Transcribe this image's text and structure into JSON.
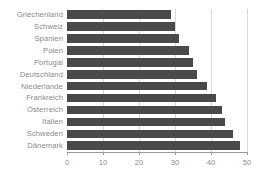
{
  "chart_data": {
    "type": "bar",
    "orientation": "horizontal",
    "title": "",
    "subtitle": "",
    "xlabel": "",
    "ylabel": "",
    "categories": [
      "Griechenland",
      "Schweiz",
      "Spanien",
      "Polen",
      "Portugal",
      "Deutschland",
      "Niederlande",
      "Frankreich",
      "Österreich",
      "Italien",
      "Schweden",
      "Dänemark"
    ],
    "values": [
      29,
      30,
      31,
      34,
      35,
      36,
      39,
      41.5,
      43,
      44,
      46,
      48
    ],
    "xlim": [
      0,
      50
    ],
    "xticks": [
      0,
      10,
      20,
      30,
      40,
      50
    ],
    "xtick_labels": [
      "0",
      "10",
      "20",
      "30",
      "40",
      "50"
    ],
    "grid": "vertical",
    "legend": "none",
    "bar_color": "#4a4a4a",
    "grid_color": "#d8d8d8",
    "axis_color": "#9a9a9a",
    "label_color": "#8a8a8a",
    "background_color": "#ffffff"
  }
}
